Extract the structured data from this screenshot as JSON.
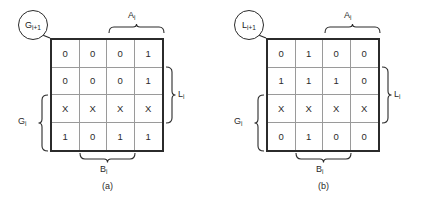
{
  "figure": {
    "type": "karnaugh-map-pair",
    "panels": [
      {
        "id": "a",
        "caption": "(a)",
        "callout": {
          "base": "G",
          "sub": "i+1",
          "full": "G i+1"
        },
        "top_label": {
          "base": "A",
          "sub": "i",
          "full": "A i"
        },
        "bottom_label": {
          "base": "B",
          "sub": "i",
          "full": "B i"
        },
        "right_label": {
          "base": "L",
          "sub": "i",
          "full": "L i"
        },
        "left_label": {
          "base": "G",
          "sub": "i",
          "full": "G i"
        },
        "rows": [
          [
            "0",
            "0",
            "0",
            "1"
          ],
          [
            "0",
            "0",
            "0",
            "1"
          ],
          [
            "X",
            "X",
            "X",
            "X"
          ],
          [
            "1",
            "0",
            "1",
            "1"
          ]
        ]
      },
      {
        "id": "b",
        "caption": "(b)",
        "callout": {
          "base": "L",
          "sub": "i+1",
          "full": "L i+1"
        },
        "top_label": {
          "base": "A",
          "sub": "i",
          "full": "A i"
        },
        "bottom_label": {
          "base": "B",
          "sub": "i",
          "full": "B i"
        },
        "right_label": {
          "base": "L",
          "sub": "i",
          "full": "L i"
        },
        "left_label": {
          "base": "G",
          "sub": "i",
          "full": "G i"
        },
        "rows": [
          [
            "0",
            "1",
            "0",
            "0"
          ],
          [
            "1",
            "1",
            "1",
            "0"
          ],
          [
            "X",
            "X",
            "X",
            "X"
          ],
          [
            "0",
            "1",
            "0",
            "0"
          ]
        ]
      }
    ],
    "colors": {
      "outer_border": "#2b2b2b",
      "inner_grid": "#9a9a9a",
      "text": "#2b2b2b",
      "background": "#ffffff"
    }
  }
}
